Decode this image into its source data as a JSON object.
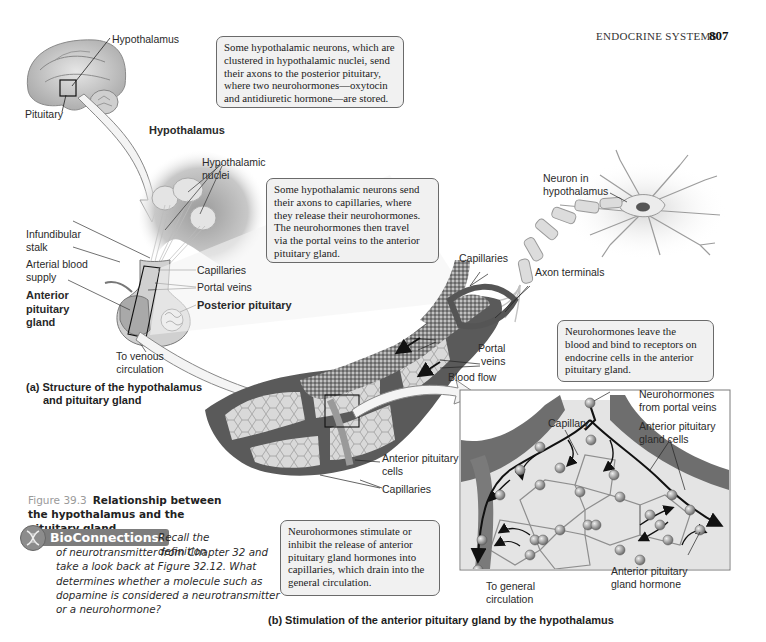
{
  "page_header": {
    "running_title": "ENDOCRINE SYSTEMS",
    "page_number": "807"
  },
  "panel_a": {
    "labels": {
      "hypothalamus_brain": "Hypothalamus",
      "pituitary_brain": "Pituitary",
      "hypothalamus_heading": "Hypothalamus",
      "hypothalamic_nuclei": [
        "Hypothalamic",
        "nuclei"
      ],
      "infundibular_stalk": [
        "Infundibular",
        "stalk"
      ],
      "arterial_blood_supply": [
        "Arterial blood",
        "supply"
      ],
      "anterior_pituitary_gland": [
        "Anterior",
        "pituitary",
        "gland"
      ],
      "capillaries": "Capillaries",
      "portal_veins": "Portal veins",
      "posterior_pituitary": "Posterior pituitary",
      "venous_circulation": [
        "To venous",
        "circulation"
      ]
    },
    "caption": [
      "(a) Structure of the hypothalamus",
      "and pituitary gland"
    ],
    "callout_posterior": [
      "Some hypothalamic neurons, which are",
      "clustered in hypothalamic nuclei, send",
      "their axons to the posterior pituitary,",
      "where two neurohormones—oxytocin",
      "and antidiuretic hormone—are stored."
    ]
  },
  "panel_middle": {
    "callout_capillaries": [
      "Some hypothalamic neurons send",
      "their axons to capillaries, where",
      "they release their neurohormones.",
      "The neurohormones then travel",
      "via the portal veins to the anterior",
      "pituitary gland."
    ],
    "labels": {
      "neuron_in_hypothalamus": [
        "Neuron in",
        "hypothalamus"
      ],
      "capillaries_top": "Capillaries",
      "axon_terminals": "Axon terminals",
      "portal_veins": [
        "Portal",
        "veins"
      ],
      "blood_flow": "Blood flow",
      "anterior_pituitary_cells": [
        "Anterior pituitary",
        "cells"
      ],
      "capillaries_bottom": "Capillaries"
    }
  },
  "panel_b": {
    "callout_receptors": [
      "Neurohormones leave the",
      "blood and bind to receptors on",
      "endocrine cells in the anterior",
      "pituitary gland."
    ],
    "callout_stimulate": [
      "Neurohormones stimulate or",
      "inhibit the release of anterior",
      "pituitary gland hormones into",
      "capillaries, which drain into the",
      "general circulation."
    ],
    "labels": {
      "neurohormones_portal": [
        "Neurohormones",
        "from portal veins"
      ],
      "capillary": "Capillary",
      "anterior_pituitary_gland_cells": [
        "Anterior pituitary",
        "gland cells"
      ],
      "anterior_pituitary_gland_hormone": [
        "Anterior pituitary",
        "gland hormone"
      ],
      "to_general_circulation": [
        "To general",
        "circulation"
      ]
    },
    "caption": "(b) Stimulation of the anterior pituitary gland by the hypothalamus"
  },
  "figure_caption": {
    "number": "Figure 39.3",
    "text": "Relationship between the hypothalamus and the pituitary gland."
  },
  "bioconnections": {
    "badge": "BioConnections:",
    "first_line": "Recall the definition",
    "lines": [
      "of neurotransmitter from Chapter 32 and",
      "take a look back at Figure 32.12. What",
      "determines whether a molecule such as",
      "dopamine is considered a neurotransmitter",
      "or a neurohormone?"
    ],
    "icon": "dna-helix-icon"
  },
  "colors": {
    "background": "#ffffff",
    "callout_fill": "#f1f1f1",
    "callout_border": "#6a6a6a",
    "tissue_dark": "#4a4a4a",
    "tissue_mid": "#9a9a9a",
    "tissue_light": "#d6d6d6",
    "badge_fill": "#7d7d7d"
  }
}
